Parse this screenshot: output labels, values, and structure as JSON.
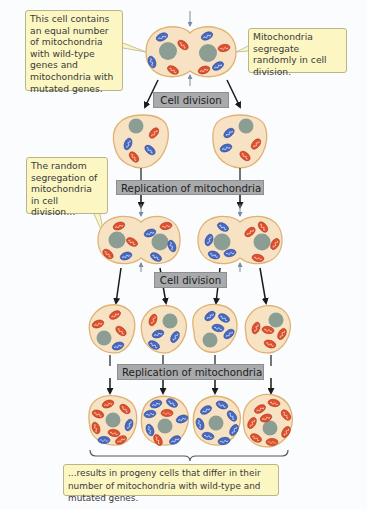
{
  "callouts": {
    "top_left": "This cell contains an equal number of mitochondria with wild-type genes and mitochondria with mutated genes.",
    "top_right": "Mitochondria segregate randomly in cell division.",
    "middle_left": "The random segregation of mitochondria in cell division…",
    "bottom": "...results in progeny cells that differ in their number of mitochondria with wild-type and mutated genes."
  },
  "labels": {
    "cell_division_1": "Cell division",
    "replication_1": "Replication of mitochondria",
    "cell_division_2": "Cell division",
    "replication_2": "Replication of mitochondria"
  },
  "colors": {
    "background": "#fbfcfd",
    "cell_fill": "#f7e3c4",
    "cell_border": "#e0b271",
    "nucleus": "#8c9e94",
    "mito_wild_type": "#4869c2",
    "mito_mutated": "#e0502e",
    "callout_fill": "#fbf6c2",
    "label_fill": "#a9aaac",
    "arrow": "#1a1a1a",
    "constriction_arrow": "#7a8aa0"
  },
  "legend_semantics": {
    "blue_mitochondria": "wild-type genes",
    "red_mitochondria": "mutated genes"
  }
}
